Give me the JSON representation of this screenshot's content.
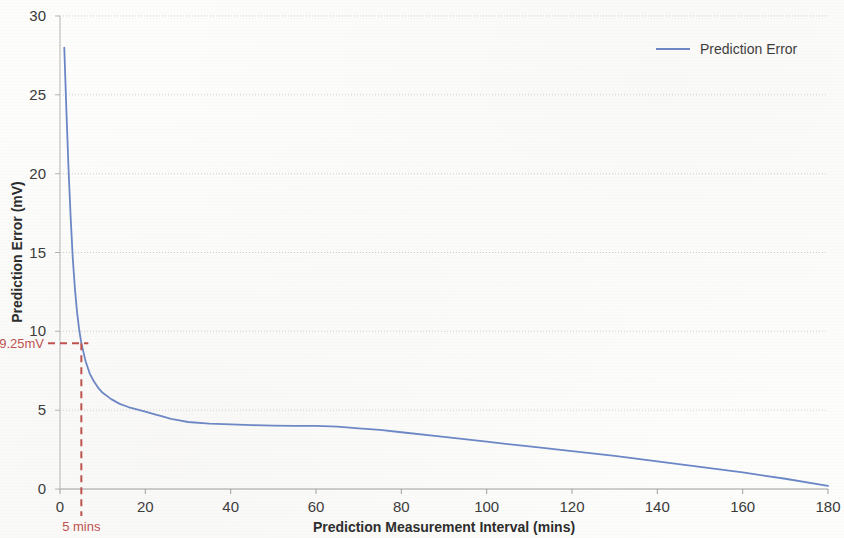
{
  "chart_data": {
    "type": "line",
    "title": "",
    "xlabel": "Prediction Measurement Interval (mins)",
    "ylabel": "Prediction Error (mV)",
    "xlim": [
      0,
      180
    ],
    "ylim": [
      0,
      30
    ],
    "grid": true,
    "grid_axis": "y",
    "legend_position": "top-right",
    "series": [
      {
        "name": "Prediction Error",
        "color": "#6b87c7",
        "x": [
          1,
          1.5,
          2,
          2.5,
          3,
          3.5,
          4,
          4.5,
          5,
          6,
          7,
          8,
          9,
          10,
          12,
          14,
          16,
          18,
          20,
          22,
          24,
          26,
          28,
          30,
          35,
          40,
          45,
          50,
          55,
          60,
          65,
          70,
          75,
          80,
          90,
          100,
          110,
          120,
          130,
          140,
          150,
          160,
          170,
          180
        ],
        "y": [
          28.0,
          24.0,
          20.3,
          17.2,
          14.6,
          12.7,
          11.2,
          10.1,
          9.25,
          8.1,
          7.3,
          6.8,
          6.4,
          6.1,
          5.7,
          5.4,
          5.2,
          5.05,
          4.9,
          4.75,
          4.6,
          4.45,
          4.35,
          4.25,
          4.15,
          4.1,
          4.05,
          4.02,
          4.0,
          4.0,
          3.95,
          3.85,
          3.75,
          3.6,
          3.3,
          3.0,
          2.7,
          2.4,
          2.1,
          1.75,
          1.4,
          1.05,
          0.65,
          0.2
        ]
      }
    ],
    "x_ticks": [
      0,
      20,
      40,
      60,
      80,
      100,
      120,
      140,
      160,
      180
    ],
    "y_ticks": [
      0,
      5,
      10,
      15,
      20,
      25,
      30
    ],
    "annotations": [
      {
        "id": "y-marker",
        "label": "9.25mV",
        "value": 9.25,
        "axis": "y",
        "color": "#c0504d",
        "style": "dashed"
      },
      {
        "id": "x-marker",
        "label": "5 mins",
        "value": 5,
        "axis": "x",
        "color": "#c0504d",
        "style": "dashed"
      }
    ]
  },
  "legend": {
    "entries": [
      {
        "label": "Prediction Error",
        "color": "#6b87c7"
      }
    ]
  },
  "colors": {
    "series_blue": "#6b87c7",
    "annotation_red": "#c0504d",
    "gridline": "#c8c8c8",
    "axis": "#b0b0b0",
    "tick_text": "#3a3a3a"
  }
}
